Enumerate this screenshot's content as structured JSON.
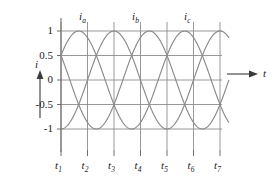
{
  "figure": {
    "title": "",
    "y_axis_label": "i",
    "x_axis_label": "t",
    "y_tick_labels": [
      "1",
      "0.5",
      "0",
      "-0.5",
      "-1"
    ],
    "x_tick_labels": [
      "t",
      "t",
      "t",
      "t",
      "t",
      "t",
      "t"
    ],
    "x_tick_subscripts": [
      "1",
      "2",
      "3",
      "4",
      "5",
      "6",
      "7"
    ],
    "curve_labels": [
      {
        "base": "i",
        "sub": "a"
      },
      {
        "base": "i",
        "sub": "b"
      },
      {
        "base": "i",
        "sub": "c"
      }
    ],
    "colors": {
      "curve": "#8a8a8a",
      "grid": "#8c8c8c",
      "axis": "#6e6e6e",
      "text": "#1a1a1a",
      "background": "#ffffff"
    }
  },
  "chart_data": {
    "type": "line",
    "title": "",
    "xlabel": "t",
    "ylabel": "i",
    "xlim": [
      0,
      6
    ],
    "ylim": [
      -1,
      1
    ],
    "grid": true,
    "legend": "none",
    "y_ticks": [
      1,
      0.5,
      0,
      -0.5,
      -1
    ],
    "y_tick_labels": [
      "1",
      "0.5",
      "0",
      "-0.5",
      "-1"
    ],
    "x_ticks": [
      0,
      1,
      2,
      3,
      4,
      5,
      6
    ],
    "x_tick_labels": [
      "t1",
      "t2",
      "t3",
      "t4",
      "t5",
      "t6",
      "t7"
    ],
    "annotations": [
      {
        "text": "ia",
        "x": 0.82,
        "y": 1.18
      },
      {
        "text": "ib",
        "x": 2.85,
        "y": 1.18
      },
      {
        "text": "ic",
        "x": 4.85,
        "y": 1.18
      }
    ],
    "series": [
      {
        "name": "ia",
        "amplitude": 1,
        "period_in_ticks": 4,
        "phase_deg": 30,
        "formula": "sin(90*x + 30) deg",
        "x": [
          0,
          0.25,
          0.5,
          0.75,
          1,
          1.25,
          1.5,
          1.75,
          2,
          2.25,
          2.5,
          2.75,
          3,
          3.25,
          3.5,
          3.75,
          4,
          4.25,
          4.5,
          4.75,
          5,
          5.25,
          5.5,
          5.75,
          6,
          6.33
        ],
        "values": [
          0.5,
          0.707,
          0.866,
          0.966,
          1.0,
          0.966,
          0.866,
          0.707,
          0.5,
          0.259,
          0.0,
          -0.259,
          -0.5,
          -0.707,
          -0.866,
          -0.966,
          -1.0,
          -0.966,
          -0.866,
          -0.707,
          -0.5,
          -0.259,
          0.0,
          0.259,
          0.5,
          0.79
        ]
      },
      {
        "name": "ib",
        "amplitude": 1,
        "period_in_ticks": 4,
        "phase_deg": -90,
        "formula": "sin(90*x - 90) deg",
        "x": [
          0,
          0.25,
          0.5,
          0.75,
          1,
          1.25,
          1.5,
          1.75,
          2,
          2.25,
          2.5,
          2.75,
          3,
          3.25,
          3.5,
          3.75,
          4,
          4.25,
          4.5,
          4.75,
          5,
          5.25,
          5.5,
          5.75,
          6,
          6.33
        ],
        "values": [
          -1.0,
          -0.966,
          -0.866,
          -0.707,
          -0.5,
          -0.259,
          0.0,
          0.259,
          0.5,
          0.707,
          0.866,
          0.966,
          1.0,
          0.966,
          0.866,
          0.707,
          0.5,
          0.259,
          0.0,
          -0.259,
          -0.5,
          -0.707,
          -0.866,
          -0.966,
          -1.0,
          -0.95
        ]
      },
      {
        "name": "ic",
        "amplitude": 1,
        "period_in_ticks": 4,
        "phase_deg": 150,
        "formula": "sin(90*x + 150) deg",
        "x": [
          0,
          0.25,
          0.5,
          0.75,
          1,
          1.25,
          1.5,
          1.75,
          2,
          2.25,
          2.5,
          2.75,
          3,
          3.25,
          3.5,
          3.75,
          4,
          4.25,
          4.5,
          4.75,
          5,
          5.25,
          5.5,
          5.75,
          6,
          6.33
        ],
        "values": [
          0.5,
          0.259,
          0.0,
          -0.259,
          -0.5,
          -0.707,
          -0.866,
          -0.966,
          -1.0,
          -0.966,
          -0.866,
          -0.707,
          -0.5,
          -0.259,
          0.0,
          0.259,
          0.5,
          0.707,
          0.866,
          0.966,
          1.0,
          0.966,
          0.866,
          0.707,
          0.5,
          0.16
        ]
      }
    ]
  }
}
